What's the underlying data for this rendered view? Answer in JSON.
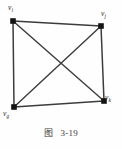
{
  "figure": {
    "caption_label": "图",
    "caption_number": "3-19",
    "background_color": "#fefefe",
    "stroke_color": "#3c3c3c",
    "vertex_color": "#1a1a1a"
  },
  "graph": {
    "type": "complete-graph-k4",
    "vertices": [
      {
        "id": "vi",
        "label_base": "v",
        "label_sub": "i",
        "x": 13,
        "y": 21
      },
      {
        "id": "vj",
        "label_base": "v",
        "label_sub": "j",
        "x": 101,
        "y": 26
      },
      {
        "id": "vg",
        "label_base": "v",
        "label_sub": "g",
        "x": 14,
        "y": 107
      },
      {
        "id": "vk",
        "label_base": "v",
        "label_sub": "k",
        "x": 104,
        "y": 101
      }
    ],
    "edges": [
      {
        "from": "vi",
        "to": "vj",
        "kind": "perimeter-top"
      },
      {
        "from": "vj",
        "to": "vk",
        "kind": "perimeter-right"
      },
      {
        "from": "vk",
        "to": "vg",
        "kind": "perimeter-bottom"
      },
      {
        "from": "vg",
        "to": "vi",
        "kind": "perimeter-left"
      },
      {
        "from": "vi",
        "to": "vk",
        "kind": "diagonal"
      },
      {
        "from": "vj",
        "to": "vg",
        "kind": "diagonal"
      }
    ]
  }
}
